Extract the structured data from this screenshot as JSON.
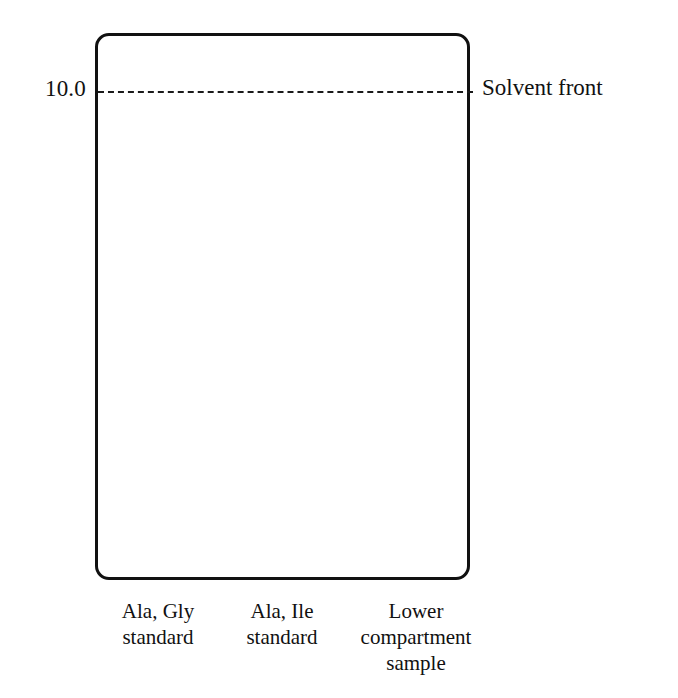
{
  "chart_data": {
    "type": "scatter",
    "title": "",
    "xlabel": "",
    "ylabel": "",
    "ylim": [
      0,
      11.0
    ],
    "grid": false,
    "legend_position": "none",
    "y_ticks": [
      {
        "label": "10.0",
        "value": 10.0
      },
      {
        "label": "7.5",
        "value": 7.5
      },
      {
        "label": "5.0",
        "value": 5.0
      },
      {
        "label": "2.5",
        "value": 2.5
      }
    ],
    "reference_lines": [
      {
        "name": "solvent-front",
        "label": "Solvent front",
        "value": 10.0,
        "style": "dashed"
      },
      {
        "name": "origin-baseline",
        "label": "",
        "value": 0.15,
        "style": "dashed"
      }
    ],
    "categories": [
      "Ala, Gly\nstandard",
      "Ala, Ile\nstandard",
      "Lower\ncompartment\nsample"
    ],
    "lanes": [
      {
        "name": "lane-1",
        "caption": "Ala, Gly\nstandard",
        "origin_marker": "X",
        "spots": [
          6.1,
          5.05
        ]
      },
      {
        "name": "lane-2",
        "caption": "Ala, Ile\nstandard",
        "origin_marker": "X",
        "spots": [
          5.07,
          3.3
        ]
      },
      {
        "name": "lane-3",
        "caption": "Lower\ncompartment\nsample",
        "origin_marker": "X",
        "spots": [
          6.1,
          5.05,
          3.3,
          2.1
        ]
      }
    ]
  },
  "colors": {
    "spot": "#0b0b0b",
    "plate_border": "#111111",
    "dashed_line": "#1a1a1a",
    "text": "#111111",
    "background": "#ffffff"
  }
}
